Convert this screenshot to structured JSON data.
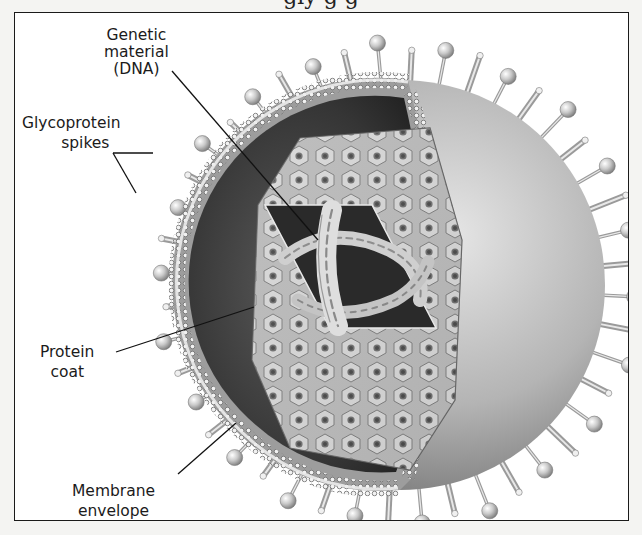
{
  "figure": {
    "type": "labeled-illustration",
    "top_clipped_text": "gly                                        g                   g",
    "frame": {
      "x": 14,
      "y": 12,
      "width": 615,
      "height": 509,
      "border_color": "#1a1a1a"
    },
    "colors": {
      "background": "#ffffff",
      "page": "#f4f4f2",
      "envelope_light": "#d9d9d9",
      "envelope_mid": "#a9a9a9",
      "envelope_dark": "#6e6e6e",
      "interior_dark": "#2e2e2e",
      "coat": "#bdbdbd",
      "leader_line": "#111111",
      "label_text": "#1b1b1b"
    },
    "virus": {
      "cx": 400,
      "cy": 285,
      "outer_r": 205,
      "membrane_r": 186
    },
    "labels": [
      {
        "id": "genetic-material",
        "lines": [
          "Genetic",
          "material",
          "(DNA)"
        ],
        "x": 140,
        "y": 26,
        "leader": [
          [
            {
              "x1": 172,
              "y1": 71,
              "x2": 318,
              "y2": 240
            }
          ]
        ]
      },
      {
        "id": "glycoprotein-spikes",
        "lines": [
          "Glycoprotein",
          "spikes"
        ],
        "x": 78,
        "y": 113,
        "leader": [
          [
            {
              "x1": 113,
              "y1": 153,
              "x2": 153,
              "y2": 153
            }
          ],
          [
            {
              "x1": 113,
              "y1": 153,
              "x2": 136,
              "y2": 193
            }
          ]
        ]
      },
      {
        "id": "protein-coat",
        "lines": [
          "Protein",
          "coat"
        ],
        "x": 70,
        "y": 341,
        "leader": [
          [
            {
              "x1": 116,
              "y1": 352,
              "x2": 254,
              "y2": 307
            }
          ]
        ]
      },
      {
        "id": "membrane-envelope",
        "lines": [
          "Membrane",
          "envelope"
        ],
        "x": 112,
        "y": 481,
        "leader": [
          [
            {
              "x1": 178,
              "y1": 474,
              "x2": 236,
              "y2": 423
            }
          ]
        ]
      }
    ]
  }
}
